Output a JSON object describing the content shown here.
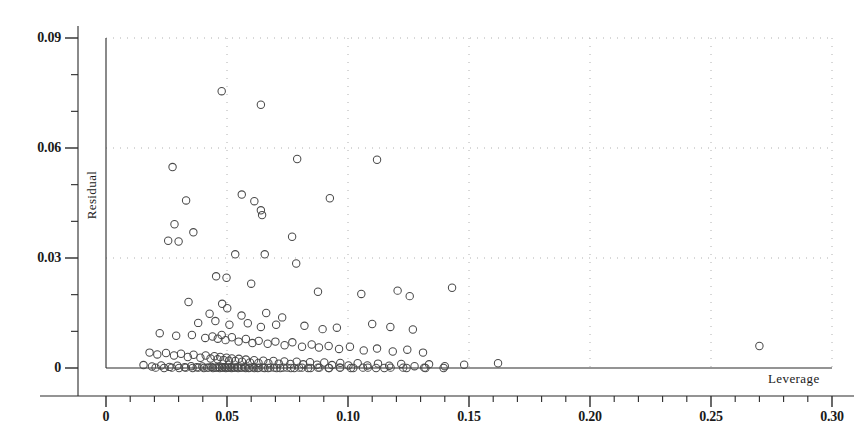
{
  "chart_data": {
    "type": "scatter",
    "title": "",
    "xlabel": "Leverage",
    "ylabel": "Residual",
    "xlim": [
      0.0,
      0.3
    ],
    "ylim": [
      0.0,
      0.09
    ],
    "xticks": [
      0.0,
      0.05,
      0.1,
      0.15,
      0.2,
      0.25,
      0.3
    ],
    "xtick_labels": [
      "0",
      "0.05",
      "0.10",
      "0.15",
      "0.20",
      "0.25",
      "0.30"
    ],
    "yticks": [
      0.0,
      0.03,
      0.06,
      0.09
    ],
    "ytick_labels": [
      "0",
      "0.03",
      "0.06",
      "0.09"
    ],
    "x_minor_tick_interval": 0.01,
    "y_minor_tick_interval": 0.01,
    "grid": "dotted-both-axes",
    "grid_color": "#b0b0b0",
    "marker": "open-circle",
    "marker_color": "#4a4a4a",
    "marker_size": 5,
    "legend": "none",
    "series": [
      {
        "name": "observations",
        "points": [
          [
            0.0478,
            0.0755
          ],
          [
            0.064,
            0.0718
          ],
          [
            0.0275,
            0.0548
          ],
          [
            0.079,
            0.057
          ],
          [
            0.112,
            0.0568
          ],
          [
            0.0331,
            0.0457
          ],
          [
            0.0561,
            0.0473
          ],
          [
            0.0613,
            0.0455
          ],
          [
            0.0925,
            0.0463
          ],
          [
            0.064,
            0.043
          ],
          [
            0.0645,
            0.0417
          ],
          [
            0.0283,
            0.0392
          ],
          [
            0.0361,
            0.037
          ],
          [
            0.0257,
            0.0347
          ],
          [
            0.03,
            0.0345
          ],
          [
            0.0769,
            0.0358
          ],
          [
            0.0534,
            0.031
          ],
          [
            0.0656,
            0.031
          ],
          [
            0.0786,
            0.0285
          ],
          [
            0.0455,
            0.025
          ],
          [
            0.0498,
            0.0246
          ],
          [
            0.06,
            0.023
          ],
          [
            0.0876,
            0.0208
          ],
          [
            0.1055,
            0.0202
          ],
          [
            0.1205,
            0.0211
          ],
          [
            0.1255,
            0.0196
          ],
          [
            0.143,
            0.0219
          ],
          [
            0.0341,
            0.018
          ],
          [
            0.048,
            0.0175
          ],
          [
            0.0501,
            0.0163
          ],
          [
            0.0428,
            0.0148
          ],
          [
            0.056,
            0.0143
          ],
          [
            0.0662,
            0.015
          ],
          [
            0.0728,
            0.0138
          ],
          [
            0.0381,
            0.0123
          ],
          [
            0.0452,
            0.0128
          ],
          [
            0.051,
            0.0118
          ],
          [
            0.0586,
            0.0122
          ],
          [
            0.064,
            0.0112
          ],
          [
            0.0703,
            0.0118
          ],
          [
            0.082,
            0.0115
          ],
          [
            0.0895,
            0.0106
          ],
          [
            0.0954,
            0.011
          ],
          [
            0.11,
            0.012
          ],
          [
            0.1175,
            0.0112
          ],
          [
            0.1268,
            0.0105
          ],
          [
            0.0222,
            0.0095
          ],
          [
            0.029,
            0.0088
          ],
          [
            0.0355,
            0.009
          ],
          [
            0.041,
            0.0082
          ],
          [
            0.044,
            0.0086
          ],
          [
            0.0462,
            0.008
          ],
          [
            0.0478,
            0.009
          ],
          [
            0.0494,
            0.0076
          ],
          [
            0.052,
            0.0084
          ],
          [
            0.0548,
            0.0072
          ],
          [
            0.0578,
            0.0079
          ],
          [
            0.0605,
            0.0068
          ],
          [
            0.0631,
            0.0074
          ],
          [
            0.0668,
            0.0066
          ],
          [
            0.07,
            0.0072
          ],
          [
            0.0738,
            0.0062
          ],
          [
            0.077,
            0.007
          ],
          [
            0.081,
            0.0058
          ],
          [
            0.085,
            0.0064
          ],
          [
            0.088,
            0.0056
          ],
          [
            0.092,
            0.006
          ],
          [
            0.0963,
            0.0052
          ],
          [
            0.1008,
            0.0058
          ],
          [
            0.1065,
            0.0048
          ],
          [
            0.112,
            0.0053
          ],
          [
            0.1185,
            0.0045
          ],
          [
            0.1245,
            0.005
          ],
          [
            0.131,
            0.0042
          ],
          [
            0.27,
            0.006
          ],
          [
            0.018,
            0.0042
          ],
          [
            0.0212,
            0.0037
          ],
          [
            0.0248,
            0.0041
          ],
          [
            0.0281,
            0.0034
          ],
          [
            0.031,
            0.0039
          ],
          [
            0.0338,
            0.003
          ],
          [
            0.0362,
            0.0036
          ],
          [
            0.039,
            0.0028
          ],
          [
            0.0412,
            0.0034
          ],
          [
            0.0432,
            0.0026
          ],
          [
            0.0448,
            0.0032
          ],
          [
            0.0461,
            0.0024
          ],
          [
            0.0472,
            0.003
          ],
          [
            0.0486,
            0.0022
          ],
          [
            0.0498,
            0.0028
          ],
          [
            0.0508,
            0.002
          ],
          [
            0.052,
            0.0026
          ],
          [
            0.0534,
            0.0019
          ],
          [
            0.0549,
            0.0025
          ],
          [
            0.0562,
            0.0017
          ],
          [
            0.0578,
            0.0023
          ],
          [
            0.0595,
            0.0015
          ],
          [
            0.0612,
            0.0021
          ],
          [
            0.063,
            0.0014
          ],
          [
            0.065,
            0.002
          ],
          [
            0.0671,
            0.0013
          ],
          [
            0.0692,
            0.0019
          ],
          [
            0.0714,
            0.0012
          ],
          [
            0.0737,
            0.0018
          ],
          [
            0.0762,
            0.0011
          ],
          [
            0.0788,
            0.0017
          ],
          [
            0.0815,
            0.001
          ],
          [
            0.0843,
            0.0016
          ],
          [
            0.0872,
            0.0009
          ],
          [
            0.0902,
            0.0015
          ],
          [
            0.0934,
            0.0008
          ],
          [
            0.0968,
            0.0014
          ],
          [
            0.1002,
            0.0007
          ],
          [
            0.104,
            0.0013
          ],
          [
            0.108,
            0.0007
          ],
          [
            0.1124,
            0.0012
          ],
          [
            0.117,
            0.0006
          ],
          [
            0.122,
            0.0011
          ],
          [
            0.1275,
            0.0005
          ],
          [
            0.1335,
            0.001
          ],
          [
            0.14,
            0.0005
          ],
          [
            0.148,
            0.0009
          ],
          [
            0.162,
            0.0013
          ],
          [
            0.0155,
            0.0008
          ],
          [
            0.019,
            0.0004
          ],
          [
            0.0228,
            0.0007
          ],
          [
            0.0262,
            0.0003
          ],
          [
            0.0295,
            0.0006
          ],
          [
            0.0325,
            0.0002
          ],
          [
            0.0352,
            0.0005
          ],
          [
            0.0375,
            0.0002
          ],
          [
            0.0398,
            0.0004
          ],
          [
            0.0418,
            0.0001
          ],
          [
            0.0436,
            0.0003
          ],
          [
            0.0452,
            0.0001
          ],
          [
            0.0466,
            0.0003
          ],
          [
            0.0479,
            0.0001
          ],
          [
            0.0491,
            0.0002
          ],
          [
            0.0503,
            0.0001
          ],
          [
            0.0515,
            0.0002
          ],
          [
            0.0528,
            0.0001
          ],
          [
            0.0542,
            0.0002
          ],
          [
            0.0557,
            0.0001
          ],
          [
            0.0573,
            0.0002
          ],
          [
            0.059,
            0.0
          ],
          [
            0.0608,
            0.0002
          ],
          [
            0.0627,
            0.0
          ],
          [
            0.0648,
            0.0001
          ],
          [
            0.067,
            0.0
          ],
          [
            0.0694,
            0.0001
          ],
          [
            0.072,
            0.0
          ],
          [
            0.0748,
            0.0001
          ],
          [
            0.0778,
            0.0
          ],
          [
            0.081,
            0.0001
          ],
          [
            0.0845,
            0.0
          ],
          [
            0.0882,
            0.0001
          ],
          [
            0.0922,
            0.0
          ],
          [
            0.0966,
            0.0001
          ],
          [
            0.1012,
            0.0
          ],
          [
            0.1062,
            0.0001
          ],
          [
            0.1116,
            0.0
          ],
          [
            0.1176,
            0.0001
          ],
          [
            0.1242,
            0.0
          ],
          [
            0.1315,
            0.0001
          ],
          [
            0.1395,
            0.0
          ],
          [
            0.0205,
            0.0001
          ],
          [
            0.024,
            0.0
          ],
          [
            0.0272,
            0.0001
          ],
          [
            0.0302,
            0.0
          ],
          [
            0.033,
            0.0001
          ],
          [
            0.0358,
            0.0
          ],
          [
            0.0382,
            0.0001
          ],
          [
            0.0404,
            0.0
          ],
          [
            0.0424,
            0.0001
          ],
          [
            0.0442,
            0.0
          ],
          [
            0.0458,
            0.0001
          ],
          [
            0.047,
            0.0
          ],
          [
            0.0482,
            0.0001
          ],
          [
            0.0495,
            0.0
          ],
          [
            0.0507,
            0.0001
          ],
          [
            0.0519,
            0.0
          ],
          [
            0.0532,
            0.0001
          ],
          [
            0.0546,
            0.0
          ],
          [
            0.0561,
            0.0001
          ],
          [
            0.0577,
            0.0
          ],
          [
            0.0594,
            0.0001
          ],
          [
            0.0613,
            0.0
          ],
          [
            0.0633,
            0.0001
          ],
          [
            0.0655,
            0.0
          ],
          [
            0.0679,
            0.0001
          ],
          [
            0.0705,
            0.0
          ],
          [
            0.0733,
            0.0001
          ],
          [
            0.0764,
            0.0
          ],
          [
            0.0798,
            0.0001
          ],
          [
            0.0835,
            0.0
          ],
          [
            0.0876,
            0.0001
          ],
          [
            0.092,
            0.0
          ],
          [
            0.0968,
            0.0001
          ],
          [
            0.1022,
            0.0
          ],
          [
            0.1082,
            0.0001
          ],
          [
            0.115,
            0.0
          ],
          [
            0.1228,
            0.0001
          ],
          [
            0.132,
            0.0
          ]
        ]
      }
    ]
  }
}
